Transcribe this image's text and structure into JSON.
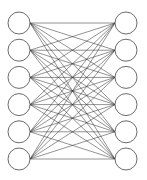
{
  "diagram": {
    "type": "bipartite-network",
    "colors": {
      "background": "#ffffff",
      "edge": "#2a2a2a",
      "node_stroke": "#5a5a5a",
      "node_fill": "#ffffff"
    },
    "geometry": {
      "width": 147,
      "height": 180,
      "node_radius": 11,
      "left_x": 19,
      "right_x": 126,
      "first_y": 23,
      "spacing_y": 27.2
    },
    "left_layer": {
      "count": 6,
      "nodes": [
        "L1",
        "L2",
        "L3",
        "L4",
        "L5",
        "L6"
      ]
    },
    "right_layer": {
      "count": 6,
      "nodes": [
        "R1",
        "R2",
        "R3",
        "R4",
        "R5",
        "R6"
      ]
    },
    "connectivity": "all-to-all",
    "edge_count": 36
  }
}
